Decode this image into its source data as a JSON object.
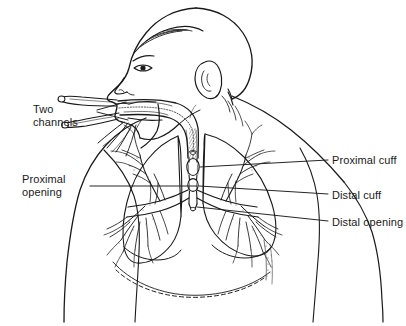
{
  "figure": {
    "background_color": "#ffffff",
    "ink_color": "#1a1a1a",
    "width": 406,
    "height": 326
  },
  "labels": {
    "two_channels": "Two\nchannels",
    "two_channels_line1": "Two",
    "two_channels_line2": "channels",
    "proximal_opening": "Proximal\nopening",
    "proximal_opening_line1": "Proximal",
    "proximal_opening_line2": "opening",
    "proximal_cuff": "Proximal cuff",
    "distal_cuff": "Distal cuff",
    "distal_opening": "Distal opening"
  },
  "anatomy": {
    "head": "head-profile-facing-left",
    "ear": "ear",
    "eye": "eye",
    "nose": "nose",
    "hair": "hair",
    "torso": "torso-and-shoulder",
    "trachea": "trachea",
    "lung_left": "left-lung",
    "lung_right": "right-lung",
    "bronchial_tree": "bronchial-tree",
    "diaphragm": "diaphragm"
  },
  "device": {
    "name": "double-lumen-endobronchial-tube",
    "channels": 2,
    "cuffs": [
      "proximal cuff",
      "distal cuff"
    ],
    "openings": [
      "proximal opening",
      "distal opening"
    ]
  }
}
